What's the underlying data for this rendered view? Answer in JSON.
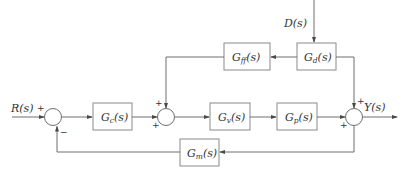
{
  "diagram": {
    "type": "feedforward-feedback control block diagram",
    "signals": {
      "input": "R(s)",
      "disturbance": "D(s)",
      "output": "Y(s)"
    },
    "blocks": [
      {
        "id": "Gff",
        "base": "G",
        "sub": "ff",
        "tail": "(s)"
      },
      {
        "id": "Gd",
        "base": "G",
        "sub": "d",
        "tail": "(s)"
      },
      {
        "id": "Gc",
        "base": "G",
        "sub": "c",
        "tail": "(s)"
      },
      {
        "id": "Gv",
        "base": "G",
        "sub": "v",
        "tail": "(s)"
      },
      {
        "id": "Gp",
        "base": "G",
        "sub": "p",
        "tail": "(s)"
      },
      {
        "id": "Gm",
        "base": "G",
        "sub": "m",
        "tail": "(s)"
      }
    ],
    "signs": {
      "sum1_input": "+",
      "sum1_feedback": "−",
      "sum2_top": "+",
      "sum2_left": "+",
      "sum3_top": "+",
      "sum3_left": "+"
    },
    "edges": [
      "R(s) → Sum1",
      "Sum1 → Gc",
      "Gc → Sum2",
      "Sum2 → Gv",
      "Gv → Gp",
      "Gp → Sum3",
      "Sum3 → Y(s)",
      "D(s) → Gd",
      "Gd → Gff",
      "Gff → Sum2",
      "Gd → Sum3",
      "Sum3 → Gm",
      "Gm → Sum1 (negative)"
    ]
  }
}
